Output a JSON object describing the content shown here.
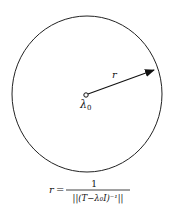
{
  "diagram": {
    "circle": {
      "cx": 87,
      "cy": 94,
      "rx": 75,
      "ry": 78,
      "stroke": "#222222"
    },
    "center_point": {
      "label_main": "λ",
      "label_sub": "0"
    },
    "radius_arrow": {
      "label": "r"
    },
    "formula": {
      "lhs": "r",
      "equals": "=",
      "numerator": "1",
      "denominator": "||(T−λ₀I)⁻¹||"
    }
  }
}
